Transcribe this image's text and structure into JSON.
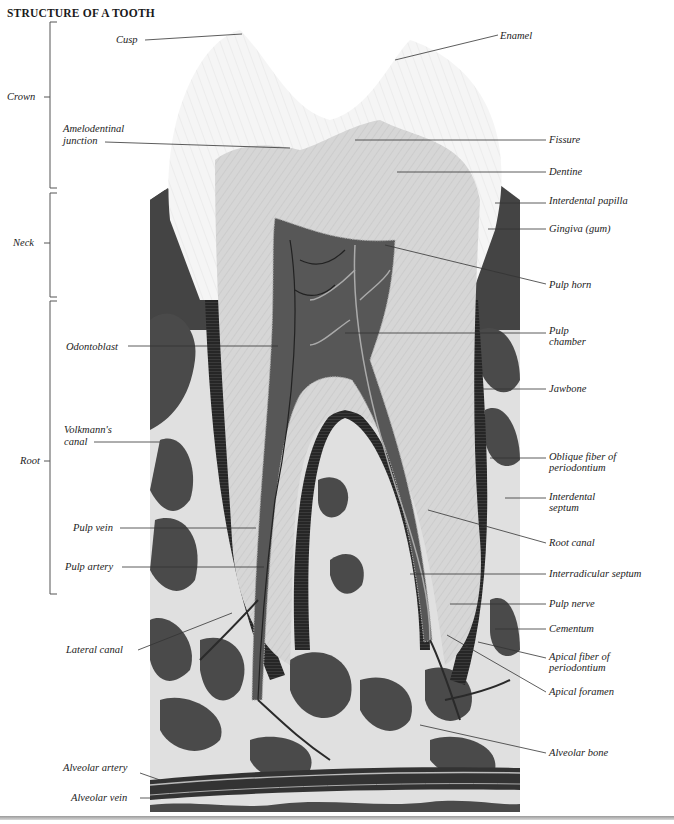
{
  "title": "STRUCTURE OF A TOOTH",
  "regions": {
    "crown": "Crown",
    "neck": "Neck",
    "root": "Root"
  },
  "labels_left": {
    "cusp": "Cusp",
    "amelodentinal_1": "Amelodentinal",
    "amelodentinal_2": "junction",
    "odontoblast": "Odontoblast",
    "volkmann_1": "Volkmann's",
    "volkmann_2": "canal",
    "pulp_vein": "Pulp vein",
    "pulp_artery": "Pulp artery",
    "lateral_canal": "Lateral canal",
    "alveolar_artery": "Alveolar artery",
    "alveolar_vein": "Alveolar vein"
  },
  "labels_right": {
    "enamel": "Enamel",
    "fissure": "Fissure",
    "dentine": "Dentine",
    "interdental_papilla": "Interdental papilla",
    "gingiva": "Gingiva (gum)",
    "pulp_horn": "Pulp horn",
    "pulp_chamber_1": "Pulp",
    "pulp_chamber_2": "chamber",
    "jawbone": "Jawbone",
    "oblique_1": "Oblique fiber of",
    "oblique_2": "periodontium",
    "interdental_septum_1": "Interdental",
    "interdental_septum_2": "septum",
    "root_canal": "Root canal",
    "interradicular_septum": "Interradicular septum",
    "pulp_nerve": "Pulp nerve",
    "cementum": "Cementum",
    "apical_fiber_1": "Apical fiber of",
    "apical_fiber_2": "periodontium",
    "apical_foramen": "Apical foramen",
    "alveolar_bone": "Alveolar bone"
  },
  "colors": {
    "enamel": "#f4f4f4",
    "dentine": "#d4d4d4",
    "pulp": "#5a5a5a",
    "bone_dark": "#4a4a4a",
    "bone_light": "#e2e2e2",
    "gum": "#3c3c3c",
    "leader": "#333333"
  }
}
